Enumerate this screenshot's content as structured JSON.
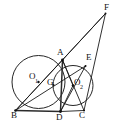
{
  "figure": {
    "type": "geometry-diagram",
    "width": 123,
    "height": 132,
    "background_color": "#ffffff",
    "stroke_color": "#1a1a1a"
  },
  "labels": {
    "A": "A",
    "B": "B",
    "C": "C",
    "D": "D",
    "E": "E",
    "F": "F",
    "G": "G",
    "O1_base": "O",
    "O1_sub": "1",
    "O2_base": "O",
    "O2_sub": "2"
  },
  "points": {
    "A": {
      "x": 62.5,
      "y": 60.0,
      "label": "A"
    },
    "B": {
      "x": 15.5,
      "y": 110.5,
      "label": "B"
    },
    "C": {
      "x": 84.0,
      "y": 110.5,
      "label": "C"
    },
    "D": {
      "x": 60.5,
      "y": 111.5,
      "label": "D"
    },
    "E": {
      "x": 85.5,
      "y": 66.0,
      "label": "E"
    },
    "F": {
      "x": 105.5,
      "y": 13.5,
      "label": "F"
    },
    "G": {
      "x": 53.5,
      "y": 85.0,
      "label": "G"
    },
    "O1": {
      "x": 38.5,
      "y": 82.0,
      "label": "O1"
    },
    "O2": {
      "x": 73.0,
      "y": 85.5,
      "label": "O2"
    }
  },
  "circles": [
    {
      "name": "circle-O1",
      "cx": 38.5,
      "cy": 82.0,
      "r": 26.5
    },
    {
      "name": "circle-O2",
      "cx": 73.0,
      "cy": 85.5,
      "r": 20.0
    }
  ],
  "segments": [
    {
      "name": "segment-A-D",
      "from": "A",
      "to": "D"
    },
    {
      "name": "segment-A-B",
      "from": "A",
      "to": "B"
    },
    {
      "name": "segment-A-O2",
      "from": "A",
      "to": "O2"
    },
    {
      "name": "segment-A-C",
      "from": "A",
      "to": "C"
    },
    {
      "name": "segment-A-F",
      "from": "A",
      "to": "F"
    },
    {
      "name": "segment-B-C",
      "from": "B",
      "to": "C"
    },
    {
      "name": "segment-B-O1",
      "from": "B",
      "to": "O1"
    },
    {
      "name": "segment-B-E",
      "from": "B",
      "to": "E"
    },
    {
      "name": "segment-O1-F",
      "from": "O1",
      "to": "F"
    },
    {
      "name": "segment-D-O2",
      "from": "D",
      "to": "O2"
    },
    {
      "name": "segment-D-E",
      "from": "D",
      "to": "E"
    },
    {
      "name": "segment-C-F",
      "from": "C",
      "to": "F"
    },
    {
      "name": "segment-B-D-baseline",
      "from": "B",
      "to": "D"
    }
  ],
  "label_positions": {
    "A": {
      "left": 57,
      "top": 49
    },
    "B": {
      "left": 12,
      "top": 112
    },
    "C": {
      "left": 80,
      "top": 112
    },
    "D": {
      "left": 57,
      "top": 114
    },
    "E": {
      "left": 86,
      "top": 54
    },
    "F": {
      "left": 105,
      "top": 4
    },
    "G": {
      "left": 48,
      "top": 79
    },
    "O1": {
      "left": 30,
      "top": 73
    },
    "O2": {
      "left": 74,
      "top": 79
    }
  }
}
